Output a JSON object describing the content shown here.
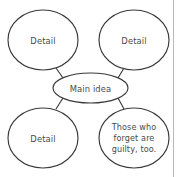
{
  "diagram": {
    "type": "main-idea-web",
    "background_color": "#ffffff",
    "stroke_color": "#3a3a3a",
    "text_color": "#4a4a4a",
    "page_rule_color": "#b9b9b9",
    "center": {
      "id": "main-idea",
      "label": "Main idea",
      "cx": 90.5,
      "cy": 88,
      "rx": 37.5,
      "ry": 15
    },
    "details": [
      {
        "id": "detail-top-left",
        "label": "Detail",
        "lines": [
          "Detail"
        ],
        "cx": 43,
        "cy": 40,
        "rx": 35,
        "ry": 30
      },
      {
        "id": "detail-top-right",
        "label": "Detail",
        "lines": [
          "Detail"
        ],
        "cx": 134,
        "cy": 40,
        "rx": 35,
        "ry": 30
      },
      {
        "id": "detail-bottom-left",
        "label": "Detail",
        "lines": [
          "Detail"
        ],
        "cx": 43,
        "cy": 138,
        "rx": 35,
        "ry": 30
      },
      {
        "id": "detail-bottom-right",
        "label": "Those who forget are guilty, too.",
        "lines": [
          "Those who",
          "forget are",
          "guilty, too."
        ],
        "cx": 134,
        "cy": 138,
        "rx": 35,
        "ry": 30
      }
    ],
    "connectors": [
      {
        "id": "connector-top-left",
        "from": "main-idea",
        "to": "detail-top-left",
        "x1": 63,
        "y1": 78,
        "x2": 56,
        "y2": 68
      },
      {
        "id": "connector-top-right",
        "from": "main-idea",
        "to": "detail-top-right",
        "x1": 118,
        "y1": 78,
        "x2": 124,
        "y2": 68
      },
      {
        "id": "connector-bottom-left",
        "from": "main-idea",
        "to": "detail-bottom-left",
        "x1": 63,
        "y1": 98,
        "x2": 56,
        "y2": 109
      },
      {
        "id": "connector-bottom-right",
        "from": "main-idea",
        "to": "detail-bottom-right",
        "x1": 118,
        "y1": 98,
        "x2": 124,
        "y2": 109
      }
    ],
    "page_rule": {
      "id": "page-right-rule",
      "x": 173.5,
      "y1": 0,
      "y2": 177
    }
  }
}
